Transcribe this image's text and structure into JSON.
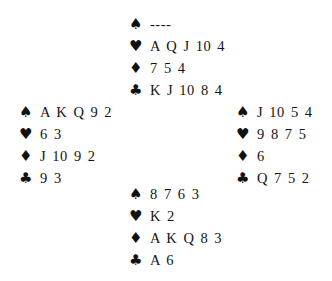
{
  "diagram": {
    "type": "bridge-deal",
    "colors": {
      "ink": "#141414",
      "paper": "#ffffff"
    },
    "void_marker": "----"
  },
  "deal": {
    "north": {
      "position": "North",
      "suits": [
        {
          "suit": "spades",
          "symbol": "♠",
          "cards": "----"
        },
        {
          "suit": "hearts",
          "symbol": "♥",
          "cards": "A Q J 10 4"
        },
        {
          "suit": "diamonds",
          "symbol": "♦",
          "cards": "7 5 4"
        },
        {
          "suit": "clubs",
          "symbol": "♣",
          "cards": "K J 10 8 4"
        }
      ]
    },
    "west": {
      "position": "West",
      "suits": [
        {
          "suit": "spades",
          "symbol": "♠",
          "cards": "A K Q 9 2"
        },
        {
          "suit": "hearts",
          "symbol": "♥",
          "cards": "6 3"
        },
        {
          "suit": "diamonds",
          "symbol": "♦",
          "cards": "J 10 9 2"
        },
        {
          "suit": "clubs",
          "symbol": "♣",
          "cards": "9 3"
        }
      ]
    },
    "east": {
      "position": "East",
      "suits": [
        {
          "suit": "spades",
          "symbol": "♠",
          "cards": "J 10 5 4"
        },
        {
          "suit": "hearts",
          "symbol": "♥",
          "cards": "9 8 7 5"
        },
        {
          "suit": "diamonds",
          "symbol": "♦",
          "cards": "6"
        },
        {
          "suit": "clubs",
          "symbol": "♣",
          "cards": "Q 7 5 2"
        }
      ]
    },
    "south": {
      "position": "South",
      "suits": [
        {
          "suit": "spades",
          "symbol": "♠",
          "cards": "8 7 6 3"
        },
        {
          "suit": "hearts",
          "symbol": "♥",
          "cards": "K 2"
        },
        {
          "suit": "diamonds",
          "symbol": "♦",
          "cards": "A K Q 8 3"
        },
        {
          "suit": "clubs",
          "symbol": "♣",
          "cards": "A 6"
        }
      ]
    }
  }
}
